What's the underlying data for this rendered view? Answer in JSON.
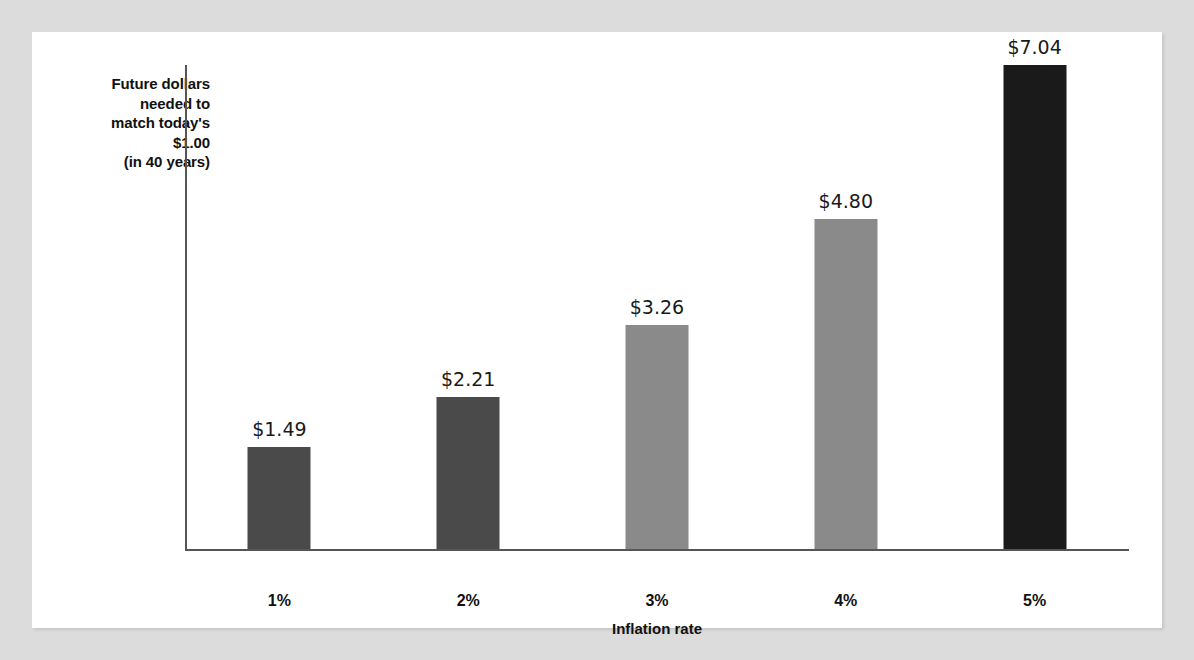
{
  "chart_data": {
    "type": "bar",
    "title": "",
    "subtitle": "",
    "categories": [
      "1%",
      "2%",
      "3%",
      "4%",
      "5%"
    ],
    "values": [
      1.49,
      2.21,
      3.26,
      4.8,
      7.04
    ],
    "value_labels": [
      "$1.49",
      "$2.21",
      "$3.26",
      "$4.80",
      "$7.04"
    ],
    "xlabel": "Inflation rate",
    "ylabel": "Future dollars needed to match today's $1.00 (in 40 years)",
    "ylabel_lines": [
      "Future dollars",
      "needed to",
      "match today's",
      "$1.00",
      "(in 40 years)"
    ],
    "ylim": [
      0,
      7.04
    ],
    "grid": false,
    "legend": false,
    "bar_colors": [
      "#4a4a4a",
      "#4a4a4a",
      "#8a8a8a",
      "#8a8a8a",
      "#1a1a1a"
    ]
  },
  "style": {
    "page_background": "#dcdcdc",
    "panel_background": "#ffffff",
    "axis_color": "#555555",
    "text_color": "#111111"
  }
}
